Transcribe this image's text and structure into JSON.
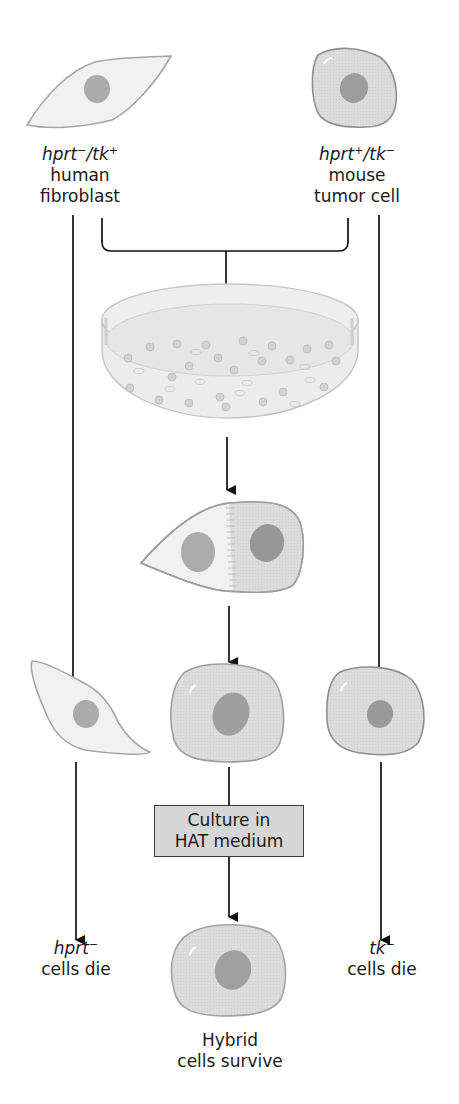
{
  "diagram": {
    "colors": {
      "background": "#ffffff",
      "cell_fill_light": "#f0f0f0",
      "cell_fill_medium": "#d9d9d9",
      "cell_outline": "#9a9a9a",
      "nucleus": "#a8a8a8",
      "nucleus_dark": "#999999",
      "arrow": "#111111",
      "box_fill": "#d6d6d6"
    },
    "parents": {
      "left": {
        "genotype_gene1": "hprt",
        "genotype_sup1": "−",
        "genotype_sep": "/",
        "genotype_gene2": "tk",
        "genotype_sup2": "+",
        "line1": "human",
        "line2": "fibroblast"
      },
      "right": {
        "genotype_gene1": "hprt",
        "genotype_sup1": "+",
        "genotype_sep": "/",
        "genotype_gene2": "tk",
        "genotype_sup2": "−",
        "line1": "mouse",
        "line2": "tumor cell"
      }
    },
    "steps": {
      "culture_box_line1": "Culture in",
      "culture_box_line2": "HAT medium"
    },
    "outcomes": {
      "left": {
        "gene": "hprt",
        "sup": "−",
        "text": "cells die"
      },
      "center": {
        "line1": "Hybrid",
        "line2": "cells survive"
      },
      "right": {
        "gene": "tk",
        "sup": "−",
        "text": "cells die"
      }
    }
  }
}
